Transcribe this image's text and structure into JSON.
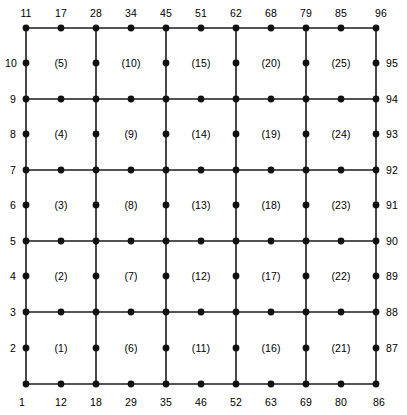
{
  "figure": {
    "kind": "finite-element-mesh-diagram",
    "colors": {
      "line": "#1a1a1a",
      "node": "#111111",
      "background": "#ffffff",
      "text": "#000000"
    },
    "geometry": {
      "grid_x": [
        26,
        96,
        166,
        236,
        306,
        376
      ],
      "grid_y": [
        28,
        99,
        170,
        241,
        312,
        384
      ],
      "node_radius": 3.4,
      "line_width": 1.6
    }
  },
  "mesh": {
    "elements_per_row": 5,
    "elements_per_column": 5,
    "element_type": "Q8",
    "nodes_per_element": 8,
    "total_elements": 25,
    "total_nodes": 96
  },
  "grid_lines": {
    "vertical_x": [
      26,
      96,
      166,
      236,
      306,
      376
    ],
    "horizontal_y": [
      28,
      99,
      170,
      241,
      312,
      384
    ]
  },
  "corner_nodes": [
    {
      "x": 26,
      "y": 28
    },
    {
      "x": 96,
      "y": 28
    },
    {
      "x": 166,
      "y": 28
    },
    {
      "x": 236,
      "y": 28
    },
    {
      "x": 306,
      "y": 28
    },
    {
      "x": 376,
      "y": 28
    },
    {
      "x": 26,
      "y": 99
    },
    {
      "x": 96,
      "y": 99
    },
    {
      "x": 166,
      "y": 99
    },
    {
      "x": 236,
      "y": 99
    },
    {
      "x": 306,
      "y": 99
    },
    {
      "x": 376,
      "y": 99
    },
    {
      "x": 26,
      "y": 170
    },
    {
      "x": 96,
      "y": 170
    },
    {
      "x": 166,
      "y": 170
    },
    {
      "x": 236,
      "y": 170
    },
    {
      "x": 306,
      "y": 170
    },
    {
      "x": 376,
      "y": 170
    },
    {
      "x": 26,
      "y": 241
    },
    {
      "x": 96,
      "y": 241
    },
    {
      "x": 166,
      "y": 241
    },
    {
      "x": 236,
      "y": 241
    },
    {
      "x": 306,
      "y": 241
    },
    {
      "x": 376,
      "y": 241
    },
    {
      "x": 26,
      "y": 312
    },
    {
      "x": 96,
      "y": 312
    },
    {
      "x": 166,
      "y": 312
    },
    {
      "x": 236,
      "y": 312
    },
    {
      "x": 306,
      "y": 312
    },
    {
      "x": 376,
      "y": 312
    },
    {
      "x": 26,
      "y": 384
    },
    {
      "x": 96,
      "y": 384
    },
    {
      "x": 166,
      "y": 384
    },
    {
      "x": 236,
      "y": 384
    },
    {
      "x": 306,
      "y": 384
    },
    {
      "x": 376,
      "y": 384
    }
  ],
  "midside_nodes_horizontal": [
    {
      "x": 61,
      "y": 28
    },
    {
      "x": 131,
      "y": 28
    },
    {
      "x": 201,
      "y": 28
    },
    {
      "x": 271,
      "y": 28
    },
    {
      "x": 341,
      "y": 28
    },
    {
      "x": 61,
      "y": 99
    },
    {
      "x": 131,
      "y": 99
    },
    {
      "x": 201,
      "y": 99
    },
    {
      "x": 271,
      "y": 99
    },
    {
      "x": 341,
      "y": 99
    },
    {
      "x": 61,
      "y": 170
    },
    {
      "x": 131,
      "y": 170
    },
    {
      "x": 201,
      "y": 170
    },
    {
      "x": 271,
      "y": 170
    },
    {
      "x": 341,
      "y": 170
    },
    {
      "x": 61,
      "y": 241
    },
    {
      "x": 131,
      "y": 241
    },
    {
      "x": 201,
      "y": 241
    },
    {
      "x": 271,
      "y": 241
    },
    {
      "x": 341,
      "y": 241
    },
    {
      "x": 61,
      "y": 312
    },
    {
      "x": 131,
      "y": 312
    },
    {
      "x": 201,
      "y": 312
    },
    {
      "x": 271,
      "y": 312
    },
    {
      "x": 341,
      "y": 312
    },
    {
      "x": 61,
      "y": 384
    },
    {
      "x": 131,
      "y": 384
    },
    {
      "x": 201,
      "y": 384
    },
    {
      "x": 271,
      "y": 384
    },
    {
      "x": 341,
      "y": 384
    }
  ],
  "midside_nodes_vertical": [
    {
      "x": 26,
      "y": 63
    },
    {
      "x": 96,
      "y": 63
    },
    {
      "x": 166,
      "y": 63
    },
    {
      "x": 236,
      "y": 63
    },
    {
      "x": 306,
      "y": 63
    },
    {
      "x": 376,
      "y": 63
    },
    {
      "x": 26,
      "y": 134
    },
    {
      "x": 96,
      "y": 134
    },
    {
      "x": 166,
      "y": 134
    },
    {
      "x": 236,
      "y": 134
    },
    {
      "x": 306,
      "y": 134
    },
    {
      "x": 376,
      "y": 134
    },
    {
      "x": 26,
      "y": 205
    },
    {
      "x": 96,
      "y": 205
    },
    {
      "x": 166,
      "y": 205
    },
    {
      "x": 236,
      "y": 205
    },
    {
      "x": 306,
      "y": 205
    },
    {
      "x": 376,
      "y": 205
    },
    {
      "x": 26,
      "y": 276
    },
    {
      "x": 96,
      "y": 276
    },
    {
      "x": 166,
      "y": 276
    },
    {
      "x": 236,
      "y": 276
    },
    {
      "x": 306,
      "y": 276
    },
    {
      "x": 376,
      "y": 276
    },
    {
      "x": 26,
      "y": 348
    },
    {
      "x": 96,
      "y": 348
    },
    {
      "x": 166,
      "y": 348
    },
    {
      "x": 236,
      "y": 348
    },
    {
      "x": 306,
      "y": 348
    },
    {
      "x": 376,
      "y": 348
    }
  ],
  "node_labels": {
    "top": [
      {
        "text": "11",
        "x": 26,
        "y": 13
      },
      {
        "text": "17",
        "x": 61,
        "y": 13
      },
      {
        "text": "28",
        "x": 96,
        "y": 13
      },
      {
        "text": "34",
        "x": 131,
        "y": 13
      },
      {
        "text": "45",
        "x": 166,
        "y": 13
      },
      {
        "text": "51",
        "x": 201,
        "y": 13
      },
      {
        "text": "62",
        "x": 236,
        "y": 13
      },
      {
        "text": "68",
        "x": 271,
        "y": 13
      },
      {
        "text": "79",
        "x": 306,
        "y": 13
      },
      {
        "text": "85",
        "x": 341,
        "y": 13
      },
      {
        "text": "96",
        "x": 381,
        "y": 13
      }
    ],
    "bottom": [
      {
        "text": "1",
        "x": 22,
        "y": 402
      },
      {
        "text": "12",
        "x": 61,
        "y": 402
      },
      {
        "text": "18",
        "x": 96,
        "y": 402
      },
      {
        "text": "29",
        "x": 131,
        "y": 402
      },
      {
        "text": "35",
        "x": 166,
        "y": 402
      },
      {
        "text": "46",
        "x": 201,
        "y": 402
      },
      {
        "text": "52",
        "x": 236,
        "y": 402
      },
      {
        "text": "63",
        "x": 271,
        "y": 402
      },
      {
        "text": "69",
        "x": 306,
        "y": 402
      },
      {
        "text": "80",
        "x": 341,
        "y": 402
      },
      {
        "text": "86",
        "x": 379,
        "y": 402
      }
    ],
    "left": [
      {
        "text": "10",
        "x": 11,
        "y": 63
      },
      {
        "text": "9",
        "x": 13,
        "y": 99
      },
      {
        "text": "8",
        "x": 13,
        "y": 134
      },
      {
        "text": "7",
        "x": 13,
        "y": 170
      },
      {
        "text": "6",
        "x": 13,
        "y": 205
      },
      {
        "text": "5",
        "x": 13,
        "y": 241
      },
      {
        "text": "4",
        "x": 13,
        "y": 276
      },
      {
        "text": "3",
        "x": 13,
        "y": 312
      },
      {
        "text": "2",
        "x": 13,
        "y": 348
      }
    ],
    "right": [
      {
        "text": "95",
        "x": 392,
        "y": 63
      },
      {
        "text": "94",
        "x": 392,
        "y": 99
      },
      {
        "text": "93",
        "x": 392,
        "y": 134
      },
      {
        "text": "92",
        "x": 392,
        "y": 170
      },
      {
        "text": "91",
        "x": 392,
        "y": 205
      },
      {
        "text": "90",
        "x": 392,
        "y": 241
      },
      {
        "text": "89",
        "x": 392,
        "y": 276
      },
      {
        "text": "88",
        "x": 392,
        "y": 312
      },
      {
        "text": "87",
        "x": 392,
        "y": 348
      }
    ]
  },
  "element_labels": [
    {
      "text": "(5)",
      "x": 61,
      "y": 63
    },
    {
      "text": "(10)",
      "x": 131,
      "y": 63
    },
    {
      "text": "(15)",
      "x": 201,
      "y": 63
    },
    {
      "text": "(20)",
      "x": 271,
      "y": 63
    },
    {
      "text": "(25)",
      "x": 341,
      "y": 63
    },
    {
      "text": "(4)",
      "x": 61,
      "y": 134
    },
    {
      "text": "(9)",
      "x": 131,
      "y": 134
    },
    {
      "text": "(14)",
      "x": 201,
      "y": 134
    },
    {
      "text": "(19)",
      "x": 271,
      "y": 134
    },
    {
      "text": "(24)",
      "x": 341,
      "y": 134
    },
    {
      "text": "(3)",
      "x": 61,
      "y": 205
    },
    {
      "text": "(8)",
      "x": 131,
      "y": 205
    },
    {
      "text": "(13)",
      "x": 201,
      "y": 205
    },
    {
      "text": "(18)",
      "x": 271,
      "y": 205
    },
    {
      "text": "(23)",
      "x": 341,
      "y": 205
    },
    {
      "text": "(2)",
      "x": 61,
      "y": 276
    },
    {
      "text": "(7)",
      "x": 131,
      "y": 276
    },
    {
      "text": "(12)",
      "x": 201,
      "y": 276
    },
    {
      "text": "(17)",
      "x": 271,
      "y": 276
    },
    {
      "text": "(22)",
      "x": 341,
      "y": 276
    },
    {
      "text": "(1)",
      "x": 61,
      "y": 348
    },
    {
      "text": "(6)",
      "x": 131,
      "y": 348
    },
    {
      "text": "(11)",
      "x": 201,
      "y": 348
    },
    {
      "text": "(16)",
      "x": 271,
      "y": 348
    },
    {
      "text": "(21)",
      "x": 341,
      "y": 348
    }
  ]
}
